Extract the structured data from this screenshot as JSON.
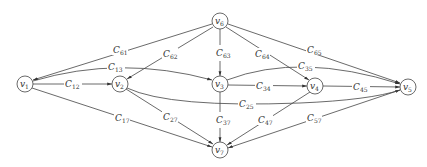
{
  "diagram": {
    "type": "directed-graph",
    "nodes": [
      {
        "id": "v6",
        "label": "v",
        "sub": "6",
        "x": 220,
        "y": 21
      },
      {
        "id": "v1",
        "label": "v",
        "sub": "1",
        "x": 25,
        "y": 84
      },
      {
        "id": "v2",
        "label": "v",
        "sub": "2",
        "x": 120,
        "y": 84
      },
      {
        "id": "v3",
        "label": "v",
        "sub": "3",
        "x": 220,
        "y": 84
      },
      {
        "id": "v4",
        "label": "v",
        "sub": "4",
        "x": 315,
        "y": 86
      },
      {
        "id": "v5",
        "label": "v",
        "sub": "5",
        "x": 408,
        "y": 87
      },
      {
        "id": "v7",
        "label": "v",
        "sub": "7",
        "x": 220,
        "y": 150
      }
    ],
    "edges": [
      {
        "from": "v6",
        "to": "v1",
        "label": "C",
        "sub": "61"
      },
      {
        "from": "v6",
        "to": "v2",
        "label": "C",
        "sub": "62"
      },
      {
        "from": "v6",
        "to": "v3",
        "label": "C",
        "sub": "63"
      },
      {
        "from": "v6",
        "to": "v4",
        "label": "C",
        "sub": "64"
      },
      {
        "from": "v6",
        "to": "v5",
        "label": "C",
        "sub": "65"
      },
      {
        "from": "v1",
        "to": "v3",
        "label": "C",
        "sub": "13"
      },
      {
        "from": "v1",
        "to": "v2",
        "label": "C",
        "sub": "12"
      },
      {
        "from": "v3",
        "to": "v5",
        "label": "C",
        "sub": "35"
      },
      {
        "from": "v3",
        "to": "v4",
        "label": "C",
        "sub": "34"
      },
      {
        "from": "v4",
        "to": "v5",
        "label": "C",
        "sub": "45"
      },
      {
        "from": "v2",
        "to": "v5",
        "label": "C",
        "sub": "25"
      },
      {
        "from": "v1",
        "to": "v7",
        "label": "C",
        "sub": "17"
      },
      {
        "from": "v2",
        "to": "v7",
        "label": "C",
        "sub": "27"
      },
      {
        "from": "v3",
        "to": "v7",
        "label": "C",
        "sub": "37"
      },
      {
        "from": "v4",
        "to": "v7",
        "label": "C",
        "sub": "47"
      },
      {
        "from": "v5",
        "to": "v7",
        "label": "C",
        "sub": "57"
      }
    ]
  },
  "labels": {
    "v6": {
      "main": "v",
      "sub": "6"
    },
    "v1": {
      "main": "v",
      "sub": "1"
    },
    "v2": {
      "main": "v",
      "sub": "2"
    },
    "v3": {
      "main": "v",
      "sub": "3"
    },
    "v4": {
      "main": "v",
      "sub": "4"
    },
    "v5": {
      "main": "v",
      "sub": "5"
    },
    "v7": {
      "main": "v",
      "sub": "7"
    },
    "c61": {
      "main": "C",
      "sub": "61"
    },
    "c62": {
      "main": "C",
      "sub": "62"
    },
    "c63": {
      "main": "C",
      "sub": "63"
    },
    "c64": {
      "main": "C",
      "sub": "64"
    },
    "c65": {
      "main": "C",
      "sub": "65"
    },
    "c13": {
      "main": "C",
      "sub": "13"
    },
    "c12": {
      "main": "C",
      "sub": "12"
    },
    "c35": {
      "main": "C",
      "sub": "35"
    },
    "c34": {
      "main": "C",
      "sub": "34"
    },
    "c45": {
      "main": "C",
      "sub": "45"
    },
    "c25": {
      "main": "C",
      "sub": "25"
    },
    "c17": {
      "main": "C",
      "sub": "17"
    },
    "c27": {
      "main": "C",
      "sub": "27"
    },
    "c37": {
      "main": "C",
      "sub": "37"
    },
    "c47": {
      "main": "C",
      "sub": "47"
    },
    "c57": {
      "main": "C",
      "sub": "57"
    }
  }
}
